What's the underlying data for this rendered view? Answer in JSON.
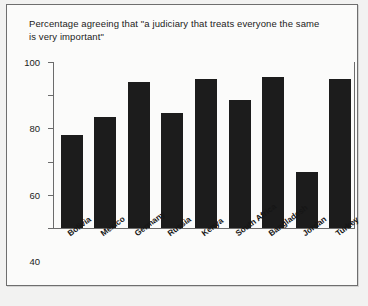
{
  "chart_data": {
    "type": "bar",
    "title": "Percentage agreeing that \"a judiciary that treats everyone the same is very important\"",
    "xlabel": "",
    "ylabel": "",
    "ylim": [
      0,
      100
    ],
    "yticks": [
      0,
      20,
      40,
      60,
      80,
      100
    ],
    "grid": false,
    "legend": null,
    "bar_color": "#1c1c1c",
    "categories": [
      "Bolivia",
      "Mexico",
      "Germany",
      "Russia",
      "Kenya",
      "South Africa",
      "Bangladesh",
      "Jordan",
      "Turkey"
    ],
    "values": [
      56,
      67,
      88,
      69,
      90,
      77,
      91,
      34,
      90
    ]
  }
}
